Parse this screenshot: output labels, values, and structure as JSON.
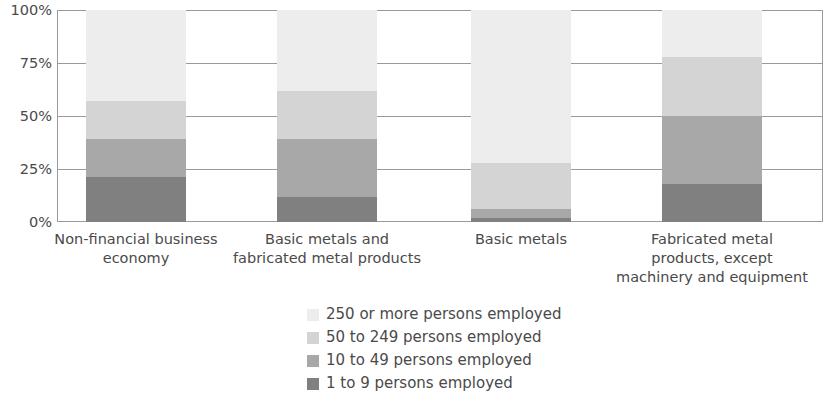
{
  "chart_data": {
    "type": "bar",
    "subtype": "stacked-percentage",
    "title": "",
    "subtitle": "",
    "xlabel": "",
    "ylabel": "",
    "ylim": [
      0,
      100
    ],
    "grid": true,
    "legend_position": "bottom-center",
    "y_ticks": [
      "0%",
      "25%",
      "50%",
      "75%",
      "100%"
    ],
    "y_tick_values": [
      0,
      25,
      50,
      75,
      100
    ],
    "categories": [
      "Non-financial business economy",
      "Basic metals and fabricated metal products",
      "Basic metals",
      "Fabricated metal products, except machinery and equipment"
    ],
    "category_lines": [
      [
        "Non-financial business",
        "economy"
      ],
      [
        "Basic metals and",
        "fabricated metal products"
      ],
      [
        "Basic metals"
      ],
      [
        "Fabricated metal",
        "products, except",
        "machinery and equipment"
      ]
    ],
    "series": [
      {
        "name": "1 to 9 persons employed",
        "color": "#808080",
        "values": [
          21,
          12,
          2,
          18
        ]
      },
      {
        "name": "10 to 49 persons employed",
        "color": "#a8a8a8",
        "values": [
          18,
          27,
          4,
          32
        ]
      },
      {
        "name": "50 to 249 persons employed",
        "color": "#d4d4d4",
        "values": [
          18,
          23,
          22,
          28
        ]
      },
      {
        "name": "250 or more persons employed",
        "color": "#ededed",
        "values": [
          43,
          38,
          72,
          22
        ]
      }
    ],
    "legend_entries": [
      {
        "label": "250 or more persons employed",
        "color": "#ededed"
      },
      {
        "label": "50 to 249 persons employed",
        "color": "#d4d4d4"
      },
      {
        "label": "10 to 49 persons employed",
        "color": "#a8a8a8"
      },
      {
        "label": "1 to 9 persons employed",
        "color": "#808080"
      }
    ],
    "axis_color": "#9a9a9a",
    "text_color": "#4a4a4a",
    "background": "#ffffff"
  }
}
